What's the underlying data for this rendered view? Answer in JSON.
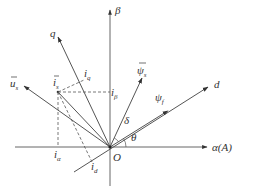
{
  "diagram": {
    "title": "",
    "origin": {
      "label": "O",
      "x": 110,
      "y": 147
    },
    "axes": {
      "alpha": {
        "label": "α(A)"
      },
      "beta": {
        "label": "β"
      },
      "d": {
        "label": "d"
      },
      "q": {
        "label": "q"
      }
    },
    "vectors": {
      "u_s": {
        "label": "u",
        "sub": "s"
      },
      "i_s": {
        "label": "i",
        "sub": "s"
      },
      "psi_s": {
        "label": "ψ",
        "sub": "s"
      },
      "psi_f": {
        "label": "ψ",
        "sub": "f"
      }
    },
    "projections": {
      "i_alpha": {
        "label": "i",
        "sub": "α"
      },
      "i_beta": {
        "label": "i",
        "sub": "β"
      },
      "i_d": {
        "label": "i",
        "sub": "d"
      },
      "i_q": {
        "label": "i",
        "sub": "q"
      }
    },
    "angles": {
      "delta": {
        "label": "δ"
      },
      "theta": {
        "label": "θ"
      }
    }
  }
}
